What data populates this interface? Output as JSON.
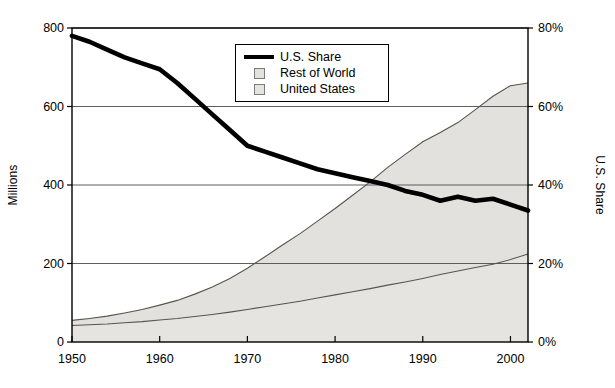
{
  "chart_data": {
    "type": "area",
    "title": "",
    "subtitle": "",
    "xlabel": "",
    "ylabel": "Millions",
    "ylabel_right": "U.S. Share",
    "xlim": [
      1950,
      2002
    ],
    "ylim": [
      0,
      800
    ],
    "ylim_right": [
      0,
      80
    ],
    "grid": true,
    "legend_position": "top-center",
    "x_ticks": [
      "1950",
      "1960",
      "1970",
      "1980",
      "1990",
      "2000"
    ],
    "x_tick_values": [
      1950,
      1960,
      1970,
      1980,
      1990,
      2000
    ],
    "y_ticks_left": [
      "0",
      "200",
      "400",
      "600",
      "800"
    ],
    "y_tick_values_left": [
      0,
      200,
      400,
      600,
      800
    ],
    "y_ticks_right": [
      "0%",
      "20%",
      "40%",
      "60%",
      "80%"
    ],
    "y_tick_values_right": [
      0,
      20,
      40,
      60,
      80
    ],
    "legend": [
      {
        "label": "U.S. Share",
        "type": "line",
        "color": "#000000"
      },
      {
        "label": "Rest of World",
        "type": "area",
        "color": "#e3e1dd"
      },
      {
        "label": "United States",
        "type": "area",
        "color": "#e6e4e0"
      }
    ],
    "x": [
      1950,
      1952,
      1954,
      1956,
      1958,
      1960,
      1962,
      1964,
      1966,
      1968,
      1970,
      1972,
      1974,
      1976,
      1978,
      1980,
      1982,
      1984,
      1986,
      1988,
      1990,
      1992,
      1994,
      1996,
      1998,
      2000,
      2002
    ],
    "series": [
      {
        "name": "United States",
        "axis": "left",
        "units": "Millions",
        "values": [
          42,
          44,
          46,
          49,
          52,
          56,
          60,
          65,
          70,
          76,
          83,
          90,
          97,
          104,
          112,
          120,
          128,
          136,
          145,
          153,
          162,
          172,
          181,
          190,
          198,
          210,
          224
        ]
      },
      {
        "name": "Rest of World",
        "axis": "left",
        "units": "Millions",
        "values": [
          13,
          16,
          20,
          25,
          31,
          38,
          46,
          57,
          70,
          86,
          105,
          127,
          150,
          172,
          196,
          220,
          246,
          272,
          300,
          325,
          348,
          362,
          378,
          402,
          428,
          443,
          436
        ]
      },
      {
        "name": "Total",
        "axis": "left",
        "units": "Millions",
        "values": [
          55,
          60,
          66,
          74,
          83,
          94,
          106,
          122,
          140,
          162,
          188,
          217,
          247,
          276,
          308,
          340,
          374,
          408,
          445,
          478,
          510,
          534,
          559,
          592,
          626,
          653,
          660
        ]
      },
      {
        "name": "U.S. Share",
        "axis": "right",
        "units": "%",
        "values": [
          78.0,
          76.5,
          74.5,
          72.5,
          71.0,
          69.5,
          66.0,
          62.0,
          58.0,
          54.0,
          50.0,
          48.5,
          47.0,
          45.5,
          44.0,
          43.0,
          42.0,
          41.0,
          40.0,
          38.5,
          37.5,
          36.0,
          37.0,
          36.0,
          36.5,
          35.0,
          33.5
        ]
      }
    ]
  }
}
